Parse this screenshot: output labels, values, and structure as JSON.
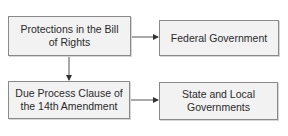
{
  "diagram": {
    "type": "flowchart",
    "colors": {
      "box_fill": "#f2f2f2",
      "box_border": "#8a8a8a",
      "text": "#2a2a2a",
      "arrow": "#333333"
    },
    "nodes": [
      {
        "id": "bill",
        "label": "Protections in the Bill of Rights"
      },
      {
        "id": "federal",
        "label": "Federal Government"
      },
      {
        "id": "due",
        "label": "Due Process Clause of the 14th Amendment"
      },
      {
        "id": "state",
        "label": "State and Local Governments"
      }
    ],
    "edges": [
      {
        "from": "bill",
        "to": "federal"
      },
      {
        "from": "bill",
        "to": "due"
      },
      {
        "from": "due",
        "to": "state"
      }
    ]
  }
}
